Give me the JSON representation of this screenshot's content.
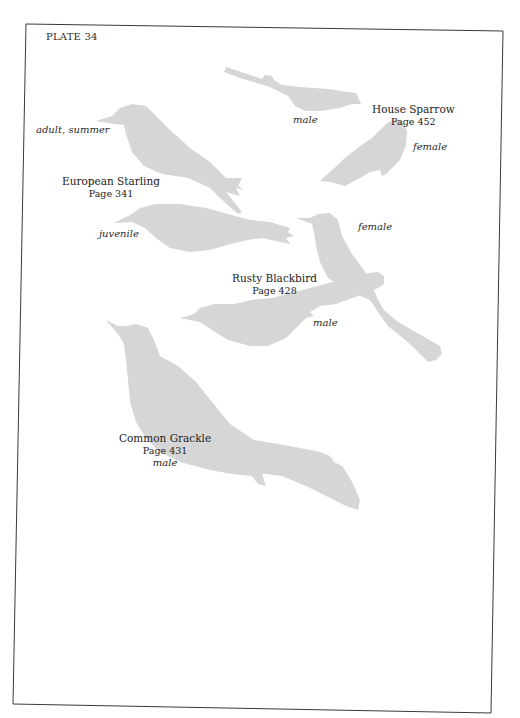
{
  "plate": {
    "title": "PLATE 34"
  },
  "colors": {
    "silhouette": "#d6d6d6",
    "border": "#3a3a3a",
    "text": "#2a2a2a",
    "paper": "#ffffff"
  },
  "species": [
    {
      "name": "House Sparrow",
      "page": "Page 452",
      "notes": [
        "male",
        "female"
      ]
    },
    {
      "name": "European Starling",
      "page": "Page 341",
      "notes": [
        "adult, summer",
        "juvenile"
      ]
    },
    {
      "name": "Rusty Blackbird",
      "page": "Page 428",
      "notes": [
        "female",
        "male"
      ]
    },
    {
      "name": "Common Grackle",
      "page": "Page 431",
      "notes": [
        "male"
      ]
    }
  ]
}
